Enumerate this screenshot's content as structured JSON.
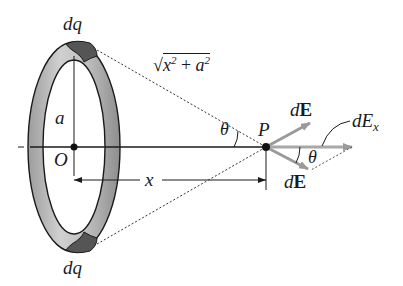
{
  "figure": {
    "type": "physics-diagram",
    "labels": {
      "dq_top": "dq",
      "dq_bottom": "dq",
      "radius": "a",
      "origin": "O",
      "point": "P",
      "distance": "x",
      "hyp_sqrt": "√",
      "hyp_x": "x",
      "hyp_x_exp": "2",
      "hyp_plus": " + ",
      "hyp_a": "a",
      "hyp_a_exp": "2",
      "theta_left": "θ",
      "theta_right": "θ",
      "dE_upper_d": "d",
      "dE_upper_E": "E",
      "dE_lower_d": "d",
      "dE_lower_E": "E",
      "dEx_d": "d",
      "dEx_E": "E",
      "dEx_sub": "x"
    },
    "colors": {
      "ring_fill": "#b8b8b8",
      "ring_dark": "#6a6a6a",
      "dq_patch": "#555555",
      "arrow": "#9a9a9a",
      "line": "#1a1a1a"
    }
  }
}
